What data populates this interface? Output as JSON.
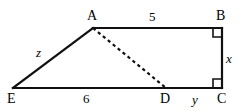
{
  "figure": {
    "stroke_color": "#111111",
    "background_color": "#ffffff",
    "vertices": [
      {
        "id": "A",
        "label": "A",
        "x": 93,
        "y": 28
      },
      {
        "id": "B",
        "label": "B",
        "x": 222,
        "y": 28
      },
      {
        "id": "C",
        "label": "C",
        "x": 222,
        "y": 88
      },
      {
        "id": "D",
        "label": "D",
        "x": 166,
        "y": 88
      },
      {
        "id": "E",
        "label": "E",
        "x": 13,
        "y": 88
      }
    ],
    "solid_edges": [
      {
        "name": "edge-A-B",
        "from": "A",
        "to": "B"
      },
      {
        "name": "edge-B-C",
        "from": "B",
        "to": "C"
      },
      {
        "name": "edge-E-C",
        "from": "E",
        "to": "C"
      },
      {
        "name": "edge-E-A",
        "from": "E",
        "to": "A"
      }
    ],
    "dashed_edges": [
      {
        "name": "edge-A-D",
        "from": "A",
        "to": "D"
      }
    ],
    "right_angle_marks": [
      {
        "name": "right-angle-B",
        "at": "B"
      },
      {
        "name": "right-angle-C",
        "at": "C"
      }
    ],
    "measures": [
      {
        "name": "length-AB",
        "text": "5",
        "italic": false
      },
      {
        "name": "length-ED",
        "text": "6",
        "italic": false
      },
      {
        "name": "length-BC",
        "text": "x",
        "italic": true
      },
      {
        "name": "length-DC",
        "text": "y",
        "italic": true
      },
      {
        "name": "length-EA",
        "text": "z",
        "italic": true
      }
    ]
  }
}
